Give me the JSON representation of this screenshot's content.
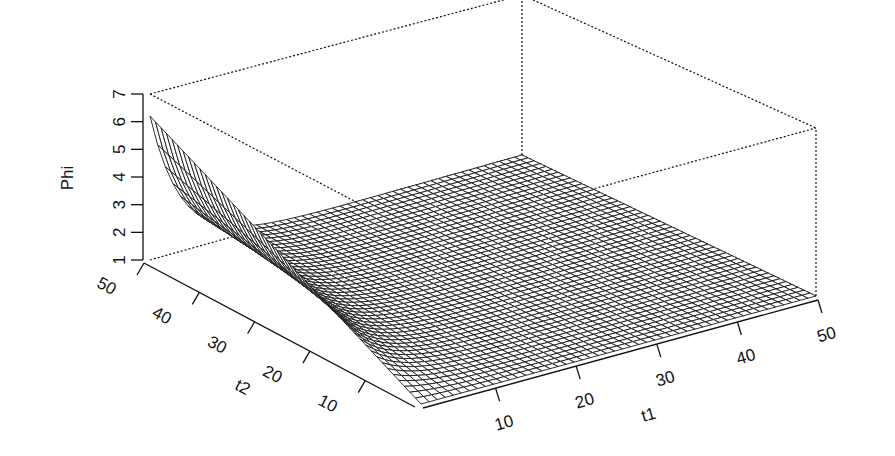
{
  "chart_data": {
    "type": "surface3d",
    "title": "",
    "xlabel": "t1",
    "ylabel": "t2",
    "zlabel": "Phi",
    "x_ticks": [
      10,
      20,
      30,
      40,
      50
    ],
    "y_ticks": [
      10,
      20,
      30,
      40,
      50
    ],
    "z_ticks": [
      1,
      2,
      3,
      4,
      5,
      6,
      7
    ],
    "x_range": [
      1,
      50
    ],
    "y_range": [
      1,
      50
    ],
    "z_range": [
      1,
      7
    ],
    "grid_resolution": 50,
    "box": true,
    "corner_values": {
      "t1_1_t2_1": 1.0,
      "t1_1_t2_50": 6.2,
      "t1_50_t2_1": 1.0,
      "t1_50_t2_50": 1.0
    },
    "edge_t1_1_profile": {
      "t2": [
        1,
        10,
        20,
        30,
        40,
        50
      ],
      "phi": [
        1.0,
        2.0,
        3.0,
        4.1,
        5.1,
        6.2
      ]
    },
    "edge_t2_50_profile": {
      "t1": [
        1,
        3,
        5,
        8,
        12,
        20,
        30,
        50
      ],
      "phi": [
        6.2,
        4.6,
        3.5,
        2.4,
        1.7,
        1.2,
        1.05,
        1.0
      ]
    }
  },
  "labels": {
    "z_axis": "Phi",
    "y_axis": "t2",
    "x_axis": "t1"
  }
}
